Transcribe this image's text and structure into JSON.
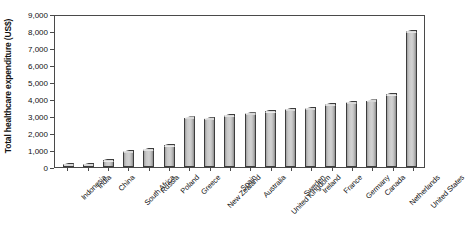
{
  "chart_data": {
    "type": "bar",
    "title": "",
    "xlabel": "",
    "ylabel": "Total healthcare expenditure (US$)",
    "ylim": [
      0,
      9000
    ],
    "ytick_step": 1000,
    "ytick_labels": [
      "9,000",
      "8,000",
      "7,000",
      "6,000",
      "5,000",
      "4,000",
      "3,000",
      "2,000",
      "1,000",
      "0"
    ],
    "ytick_values": [
      9000,
      8000,
      7000,
      6000,
      5000,
      4000,
      3000,
      2000,
      1000,
      0
    ],
    "grid": false,
    "legend": "none",
    "categories": [
      "Indonesia",
      "India",
      "China",
      "South Africa",
      "Russia",
      "Poland",
      "Greece",
      "New Zealand",
      "Spain",
      "Australia",
      "United Kingdom",
      "Sweden",
      "Ireland",
      "France",
      "Germany",
      "Canada",
      "Netherlands",
      "United States"
    ],
    "values": [
      60,
      60,
      320,
      820,
      950,
      1200,
      2800,
      2750,
      2950,
      3050,
      3200,
      3300,
      3350,
      3600,
      3700,
      3800,
      4200,
      7900
    ],
    "series": [
      {
        "name": "Total healthcare expenditure (US$)",
        "values": [
          60,
          60,
          320,
          820,
          950,
          1200,
          2800,
          2750,
          2950,
          3050,
          3200,
          3300,
          3350,
          3600,
          3700,
          3800,
          4200,
          7900
        ]
      }
    ],
    "bar_color": "#c7c7c7",
    "bar_edge_color": "#3c3c3c",
    "axis_color": "#4a4a4a",
    "background_color": "#ffffff"
  }
}
